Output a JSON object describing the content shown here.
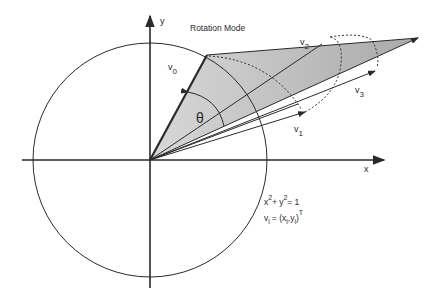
{
  "title": "Rotation Mode",
  "axes": {
    "x_label": "x",
    "y_label": "y"
  },
  "angle_label": "θ",
  "vectors": [
    {
      "name": "v",
      "sub": "0"
    },
    {
      "name": "v",
      "sub": "1"
    },
    {
      "name": "v",
      "sub": "2"
    },
    {
      "name": "v",
      "sub": "3"
    }
  ],
  "equations": {
    "circle": {
      "x": "x",
      "x_exp": "2",
      "plus": "+",
      "y": "y",
      "y_exp": "2",
      "eq": "= 1"
    },
    "vector": {
      "v": "v",
      "v_sub": "i",
      "eq": "= (x",
      "x_sub": "i",
      "y": ",y",
      "y_sub": "i",
      "close": ")",
      "T": "T"
    }
  },
  "colors": {
    "stroke": "#2a2a2a",
    "shade": "#cfcfcf",
    "shade_dark": "#a8a8a8"
  }
}
